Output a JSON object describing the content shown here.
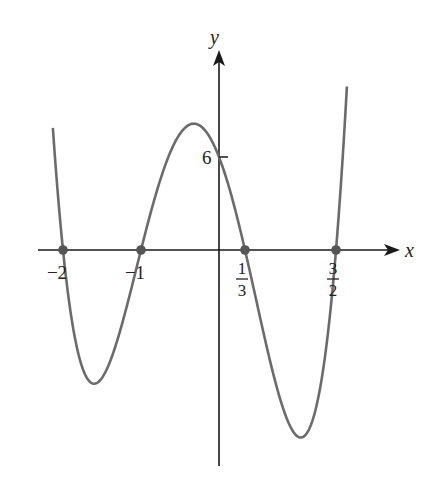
{
  "chart_data": {
    "type": "line",
    "title": "",
    "function": "y = (x+2)(x+1)(3x-1)(2x-3)",
    "xlabel": "x",
    "ylabel": "y",
    "xlim": [
      -2.3,
      2.4
    ],
    "ylim": [
      -14.5,
      13
    ],
    "grid": false,
    "legend": "none",
    "roots": [
      {
        "x": -2,
        "label_num": "−2",
        "label_den": ""
      },
      {
        "x": -1,
        "label_num": "−1",
        "label_den": ""
      },
      {
        "x": 0.3333,
        "label_num": "1",
        "label_den": "3"
      },
      {
        "x": 1.5,
        "label_num": "3",
        "label_den": "2"
      }
    ],
    "y_ticks": [
      {
        "y": 6,
        "label": "6"
      }
    ],
    "series": [
      {
        "name": "f(x)",
        "x_range": [
          -2.13,
          1.64
        ],
        "color": "#6b6b6b"
      }
    ],
    "point_color": "#555555",
    "axis_color": "#1a1a1a"
  }
}
